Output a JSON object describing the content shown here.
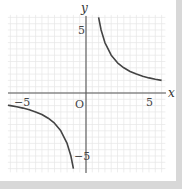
{
  "chart_data": {
    "type": "line",
    "title": "",
    "function": "y = 6/x",
    "xlabel": "x",
    "ylabel": "y",
    "origin_label": "O",
    "xlim": [
      -6.2,
      6.4
    ],
    "ylim": [
      -6.2,
      6.2
    ],
    "grid": true,
    "x_tick_labels": [
      {
        "value": -5,
        "label": "−5"
      },
      {
        "value": 5,
        "label": "5"
      }
    ],
    "y_tick_labels": [
      {
        "value": 5,
        "label": "5"
      },
      {
        "value": -5,
        "label": "−5"
      }
    ],
    "series": [
      {
        "name": "branch-positive",
        "x": [
          1.0,
          1.2,
          1.5,
          2,
          2.5,
          3,
          3.5,
          4,
          4.5,
          5,
          5.5,
          6
        ],
        "y": [
          6.0,
          5.0,
          4.0,
          3.0,
          2.4,
          2.0,
          1.71,
          1.5,
          1.33,
          1.2,
          1.09,
          1.0
        ]
      },
      {
        "name": "branch-negative",
        "x": [
          -6.2,
          -6,
          -5.5,
          -5,
          -4.5,
          -4,
          -3.5,
          -3,
          -2.5,
          -2,
          -1.5,
          -1.2,
          -1.0
        ],
        "y": [
          -0.97,
          -1.0,
          -1.09,
          -1.2,
          -1.33,
          -1.5,
          -1.71,
          -2.0,
          -2.4,
          -3.0,
          -4.0,
          -5.0,
          -6.0
        ]
      }
    ],
    "colors": {
      "curve": "#444444",
      "axis": "#555555",
      "grid": "#e6e6e6",
      "border": "#d8d8d8"
    }
  }
}
